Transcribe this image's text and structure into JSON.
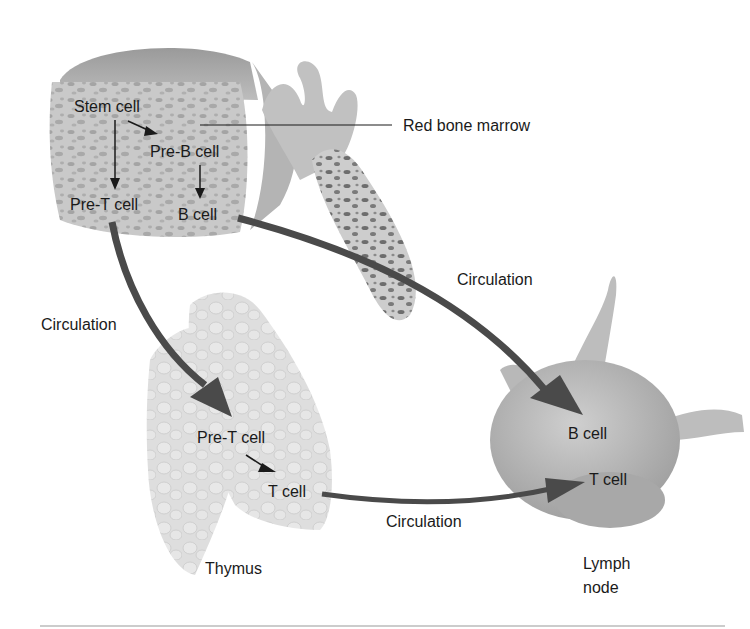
{
  "diagram": {
    "organs": {
      "bone_marrow": {
        "label": "Red bone marrow",
        "cells": [
          "Stem cell",
          "Pre-B cell",
          "Pre-T cell",
          "B cell"
        ]
      },
      "thymus": {
        "label": "Thymus",
        "cells": [
          "Pre-T cell",
          "T cell"
        ]
      },
      "lymph_node": {
        "label_line1": "Lymph",
        "label_line2": "node",
        "cells": [
          "B cell",
          "T cell"
        ]
      }
    },
    "flows": [
      {
        "from": "Stem cell",
        "to": "Pre-B cell",
        "organ": "Red bone marrow"
      },
      {
        "from": "Stem cell",
        "to": "Pre-T cell",
        "organ": "Red bone marrow"
      },
      {
        "from": "Pre-B cell",
        "to": "B cell",
        "organ": "Red bone marrow"
      },
      {
        "from": "Pre-T cell (marrow)",
        "to": "Pre-T cell (thymus)",
        "via": "Circulation"
      },
      {
        "from": "Pre-T cell",
        "to": "T cell",
        "organ": "Thymus"
      },
      {
        "from": "B cell (marrow)",
        "to": "B cell (lymph node)",
        "via": "Circulation"
      },
      {
        "from": "T cell (thymus)",
        "to": "T cell (lymph node)",
        "via": "Circulation"
      }
    ],
    "circulation_label": "Circulation",
    "colors": {
      "arrow": "#4a4a4a",
      "organ_fill": "#c8c8c8",
      "organ_dark": "#a9a9a9",
      "thymus_fill": "#dcdcdc",
      "text": "#1a1a1a",
      "rule": "#9a9a9a"
    }
  }
}
